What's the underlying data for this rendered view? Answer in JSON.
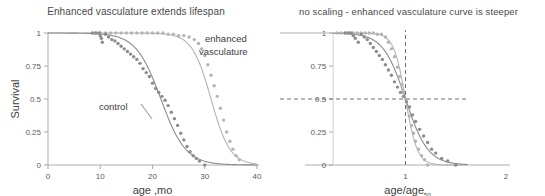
{
  "figure": {
    "panels": [
      {
        "id": "left",
        "title": "Enhanced vasculature extends lifespan",
        "xlabel": "age ,mo",
        "ylabel": "Survival",
        "annotations": [
          {
            "name": "enhanced-vasculature-label",
            "line1": "enhanced",
            "line2": "vasculature"
          },
          {
            "name": "control-label",
            "text": "control"
          }
        ]
      },
      {
        "id": "right",
        "title": "no scaling - enhanced vasculature curve is steeper",
        "xlabel_main": "age/age",
        "xlabel_sub": "50",
        "ylabel": ""
      }
    ]
  },
  "colors": {
    "control": "#8c8c8c",
    "enhanced": "#b4b4b4",
    "axis": "#b0b0b0",
    "text": "#3d3d3d",
    "tick_text": "#5a5a5a",
    "guide": "#6e6e6e"
  },
  "chart_data": [
    {
      "type": "scatter",
      "panel": "left",
      "title": "Enhanced vasculature extends lifespan",
      "xlabel": "age ,mo",
      "ylabel": "Survival",
      "xlim": [
        0,
        40
      ],
      "ylim": [
        0,
        1
      ],
      "xticks": [
        0,
        10,
        20,
        30,
        40
      ],
      "yticks": [
        0,
        0.25,
        0.5,
        0.75,
        1
      ],
      "ytick_labels": [
        "0",
        "0.25",
        "0.5",
        "0.75",
        "1"
      ],
      "grid": false,
      "legend_position": "inline-annotation",
      "series": [
        {
          "name": "control",
          "color": "#8c8c8c",
          "marker": "circle",
          "fit": {
            "model": "logistic-survival",
            "x50": 21.6,
            "slope": 0.42
          },
          "x": [
            8.5,
            9.2,
            9.8,
            10.0,
            10.2,
            10.4,
            11.0,
            11.6,
            12.2,
            12.8,
            13.4,
            14.0,
            14.6,
            15.2,
            15.8,
            16.4,
            17.0,
            17.6,
            18.2,
            18.8,
            19.4,
            20.0,
            20.6,
            21.2,
            21.8,
            22.4,
            23.0,
            23.6,
            24.2,
            24.8,
            25.4,
            26.0,
            26.6,
            27.2,
            27.8,
            28.4,
            29.0,
            30.0
          ],
          "y": [
            1.0,
            1.0,
            1.0,
            0.98,
            0.96,
            0.93,
            0.99,
            0.97,
            0.95,
            0.94,
            0.92,
            0.9,
            0.88,
            0.86,
            0.84,
            0.82,
            0.8,
            0.77,
            0.73,
            0.7,
            0.67,
            0.62,
            0.58,
            0.55,
            0.52,
            0.49,
            0.45,
            0.4,
            0.35,
            0.3,
            0.24,
            0.19,
            0.14,
            0.1,
            0.07,
            0.05,
            0.03,
            0.0
          ]
        },
        {
          "name": "enhanced vasculature",
          "color": "#b4b4b4",
          "marker": "circle",
          "fit": {
            "model": "logistic-survival",
            "x50": 31.2,
            "slope": 0.55
          },
          "x": [
            9.0,
            10.0,
            11.0,
            12.0,
            13.0,
            14.0,
            15.0,
            16.0,
            17.0,
            18.0,
            19.0,
            20.0,
            21.0,
            22.0,
            23.0,
            24.0,
            25.0,
            26.0,
            27.0,
            28.0,
            28.8,
            29.4,
            30.0,
            30.6,
            31.2,
            31.8,
            32.4,
            33.0,
            33.6,
            34.2,
            34.8,
            35.4,
            36.0,
            36.6
          ],
          "y": [
            1.0,
            1.0,
            1.0,
            1.0,
            1.0,
            1.0,
            1.0,
            1.0,
            1.0,
            1.0,
            1.0,
            1.0,
            1.0,
            1.0,
            0.99,
            0.99,
            0.98,
            0.98,
            0.97,
            0.95,
            0.92,
            0.88,
            0.83,
            0.76,
            0.68,
            0.6,
            0.52,
            0.43,
            0.34,
            0.25,
            0.18,
            0.12,
            0.07,
            0.04
          ]
        }
      ]
    },
    {
      "type": "scatter",
      "panel": "right",
      "title": "no scaling - enhanced vasculature curve is steeper",
      "xlabel": "age/age50",
      "ylabel": "",
      "xlim": [
        0,
        2
      ],
      "ylim": [
        0,
        1
      ],
      "xticks": [
        1,
        2
      ],
      "yticks": [
        0,
        0.25,
        0.5,
        0.75,
        1
      ],
      "ytick_labels": [
        "0",
        "0.25",
        "0.5",
        "0.75",
        "1"
      ],
      "grid": false,
      "reference_lines": [
        {
          "name": "h-half-survival",
          "axis": "y",
          "value": 0.5,
          "style": "dashed"
        },
        {
          "name": "v-age50",
          "axis": "x",
          "value": 1.0,
          "style": "dashed"
        }
      ],
      "series": [
        {
          "name": "control",
          "color": "#8c8c8c",
          "marker": "circle",
          "fit": {
            "model": "logistic-survival",
            "x50": 1.0,
            "slope": 9.0
          },
          "x": [
            0.4,
            0.43,
            0.46,
            0.48,
            0.5,
            0.53,
            0.56,
            0.59,
            0.62,
            0.65,
            0.68,
            0.71,
            0.74,
            0.77,
            0.8,
            0.83,
            0.86,
            0.89,
            0.92,
            0.95,
            0.98,
            1.01,
            1.04,
            1.07,
            1.1,
            1.14,
            1.18,
            1.22,
            1.26,
            1.3,
            1.36,
            1.42,
            1.5
          ],
          "y": [
            1.0,
            1.0,
            1.0,
            0.98,
            0.96,
            0.93,
            0.99,
            0.97,
            0.95,
            0.92,
            0.89,
            0.86,
            0.83,
            0.8,
            0.76,
            0.72,
            0.68,
            0.63,
            0.59,
            0.55,
            0.52,
            0.48,
            0.44,
            0.38,
            0.33,
            0.27,
            0.22,
            0.17,
            0.12,
            0.09,
            0.05,
            0.03,
            0.0
          ]
        },
        {
          "name": "enhanced vasculature",
          "color": "#b4b4b4",
          "marker": "circle",
          "fit": {
            "model": "logistic-survival",
            "x50": 1.0,
            "slope": 17.0
          },
          "x": [
            0.32,
            0.36,
            0.4,
            0.44,
            0.48,
            0.52,
            0.56,
            0.6,
            0.64,
            0.68,
            0.72,
            0.76,
            0.8,
            0.83,
            0.86,
            0.89,
            0.92,
            0.94,
            0.96,
            0.98,
            1.0,
            1.02,
            1.04,
            1.06,
            1.08,
            1.1,
            1.13,
            1.16,
            1.19,
            1.22
          ],
          "y": [
            1.0,
            1.0,
            1.0,
            1.0,
            1.0,
            1.0,
            1.0,
            1.0,
            1.0,
            1.0,
            0.99,
            0.99,
            0.97,
            0.93,
            0.88,
            0.82,
            0.74,
            0.67,
            0.61,
            0.55,
            0.5,
            0.44,
            0.37,
            0.3,
            0.24,
            0.18,
            0.12,
            0.07,
            0.04,
            0.0
          ]
        }
      ]
    }
  ]
}
